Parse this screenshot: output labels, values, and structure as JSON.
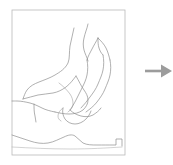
{
  "figure": {
    "title": "",
    "caption": "",
    "panels": [
      {
        "name": "sketch-map-panel",
        "label": ""
      },
      {
        "name": "arrow-panel",
        "label": ""
      }
    ]
  },
  "sketch": {
    "description": "faint hand-drawn contour sketch map",
    "frame": {
      "label": "",
      "x": 12,
      "y": 10,
      "width": 113,
      "height": 145,
      "stroke_color": "#b9b9b9",
      "stroke_width": 0.8
    },
    "stroke_color": "#8e8e8e",
    "stroke_color_light": "#b5b5b5",
    "stroke_width": 0.7,
    "background_color": "#ffffff",
    "strokes": [
      {
        "name": "ridge-upper-left",
        "color": "#8e8e8e",
        "width": 0.7,
        "d": "M 74 28 C 73 34 71 40 70 46 C 69 52 70 58 68 63 C 65 69 60 72 55 75 C 50 78 44 80 39 82 C 34 84 30 86 27 90 C 25 93 24 96 23 99"
      },
      {
        "name": "ridge-upper-left-lower",
        "color": "#8e8e8e",
        "width": 0.7,
        "d": "M 23 99 C 28 98 33 96 38 95 C 43 94 48 94 53 93 C 58 92 62 90 66 87 C 70 84 73 80 76 76"
      },
      {
        "name": "massif-outline-main",
        "color": "#8e8e8e",
        "width": 0.7,
        "d": "M 76 76 C 79 81 81 86 84 90 C 86 93 88 96 88 100 C 88 104 86 107 83 110 C 79 113 74 114 69 114 C 64 114 59 113 55 112"
      },
      {
        "name": "valley-sweep-left",
        "color": "#8e8e8e",
        "width": 0.7,
        "d": "M 55 112 C 50 111 46 110 42 108 C 38 106 34 104 30 103 C 26 102 21 101 17 101 C 15 101 14 101 12 101"
      },
      {
        "name": "spur-descending",
        "color": "#8e8e8e",
        "width": 0.7,
        "d": "M 34 104 C 34 108 34 112 35 116 C 35 118 36 120 36 122"
      },
      {
        "name": "inner-contour-a",
        "color": "#a3a3a3",
        "width": 0.6,
        "d": "M 59 83 C 63 86 67 90 70 94 C 72 97 73 100 73 104 C 73 107 71 110 68 112"
      },
      {
        "name": "tendril-upper-mid",
        "color": "#8e8e8e",
        "width": 0.7,
        "d": "M 88 24 C 87 29 85 33 84 38 C 83 42 83 46 84 50 C 85 54 87 57 88 61"
      },
      {
        "name": "peak-arrowhead",
        "color": "#8e8e8e",
        "width": 0.7,
        "d": "M 98 38 C 98 42 98 45 99 48 C 100 51 101 53 103 55"
      },
      {
        "name": "peak-left-flank",
        "color": "#8e8e8e",
        "width": 0.7,
        "d": "M 98 38 C 96 42 94 45 92 49 C 90 53 88 56 87 60"
      },
      {
        "name": "peak-right-flank",
        "color": "#8e8e8e",
        "width": 0.7,
        "d": "M 98 38 C 101 41 104 44 106 48 C 108 52 109 56 110 60"
      },
      {
        "name": "ridgeline-east-outer",
        "color": "#8e8e8e",
        "width": 0.7,
        "d": "M 110 60 C 111 65 111 70 110 75 C 109 80 107 84 105 89 C 103 94 100 98 97 102 C 94 106 90 109 86 112"
      },
      {
        "name": "ridgeline-east-inner",
        "color": "#8e8e8e",
        "width": 0.7,
        "d": "M 103 55 C 104 60 104 65 103 70 C 102 75 100 79 98 84 C 96 89 93 93 90 97 C 87 101 84 105 81 108"
      },
      {
        "name": "ridgeline-central",
        "color": "#8e8e8e",
        "width": 0.7,
        "d": "M 87 60 C 88 65 88 70 87 75 C 86 80 84 84 82 88 C 80 92 78 96 76 100 C 74 104 72 107 70 110"
      },
      {
        "name": "valley-floor-junction",
        "color": "#8e8e8e",
        "width": 0.7,
        "d": "M 70 110 C 73 113 77 115 81 116 C 85 117 89 117 93 115 C 96 113 99 111 101 108"
      },
      {
        "name": "lower-basin-outline",
        "color": "#8e8e8e",
        "width": 0.7,
        "d": "M 63 108 C 62 112 63 116 65 119 C 67 122 71 124 75 124 C 79 124 83 122 86 119 C 88 117 90 114 91 111"
      },
      {
        "name": "small-lobe",
        "color": "#a3a3a3",
        "width": 0.6,
        "d": "M 63 108 C 60 110 58 113 58 116 C 58 118 59 120 61 121"
      },
      {
        "name": "coastline-bottom",
        "color": "#8e8e8e",
        "width": 0.7,
        "d": "M 12 135 C 18 137 24 139 30 141 C 36 143 42 144 48 143 C 54 142 59 139 64 137 C 68 135 72 134 75 136 C 78 138 80 141 83 143 C 87 145 92 145 97 145 C 103 145 108 145 113 145 C 114 145 115 145 116 145 L 116 139 L 122 139 L 122 146"
      },
      {
        "name": "coastline-faint-tail",
        "color": "#b5b5b5",
        "width": 0.6,
        "d": "M 12 147 C 30 148 50 149 70 149 C 90 149 106 148 122 147"
      }
    ]
  },
  "arrow": {
    "name": "right-arrow",
    "direction": "right",
    "color": "#9c9c9c",
    "label": ""
  }
}
